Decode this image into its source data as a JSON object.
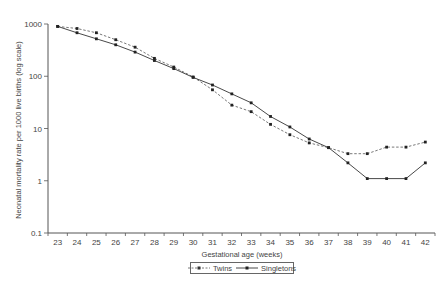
{
  "chart_data": {
    "type": "line",
    "title": "",
    "xlabel": "Gestational age (weeks)",
    "ylabel": "Neonatal mortality rate per 1000 live births (log scale)",
    "yscale": "log",
    "ylim": [
      0.1,
      1000
    ],
    "yticks": [
      "0.1",
      "1",
      "10",
      "100",
      "1000"
    ],
    "ytick_values": [
      0.1,
      1,
      10,
      100,
      1000
    ],
    "grid": false,
    "legend_position": "bottom-center",
    "categories": [
      "23",
      "24",
      "25",
      "26",
      "27",
      "28",
      "29",
      "30",
      "31",
      "32",
      "33",
      "34",
      "35",
      "36",
      "37",
      "38",
      "39",
      "40",
      "41",
      "42"
    ],
    "series": [
      {
        "name": "Twins",
        "style": "dashed",
        "marker": "dot",
        "color": "#555555",
        "values": [
          900,
          820,
          680,
          500,
          360,
          220,
          150,
          97,
          55,
          28,
          21,
          12,
          7.6,
          5.3,
          4.3,
          3.3,
          3.3,
          4.4,
          4.4,
          5.5
        ]
      },
      {
        "name": "Singletons",
        "style": "solid",
        "marker": "dot",
        "color": "#333333",
        "values": [
          900,
          680,
          520,
          400,
          290,
          200,
          140,
          95,
          68,
          46,
          31,
          17,
          10.7,
          6.3,
          4.3,
          2.2,
          1.1,
          1.1,
          1.1,
          2.2
        ]
      }
    ]
  },
  "legend": {
    "items": [
      {
        "label": "Twins"
      },
      {
        "label": "Singletons"
      }
    ]
  }
}
